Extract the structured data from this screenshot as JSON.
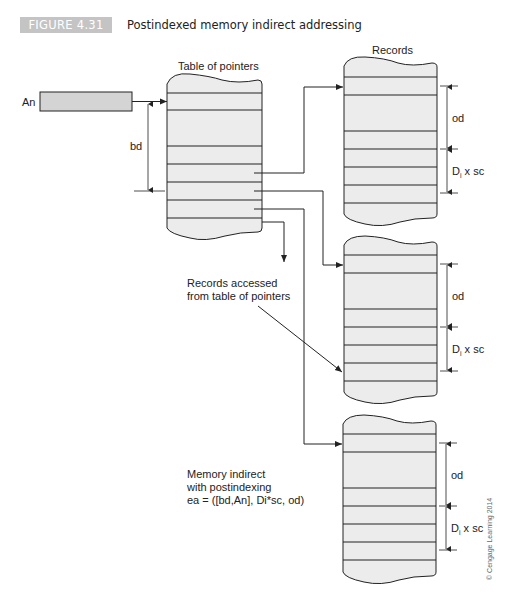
{
  "figure": {
    "badge": "FIGURE 4.31",
    "title": "Postindexed memory indirect addressing"
  },
  "labels": {
    "address_register": "An",
    "base_displacement": "bd",
    "pointer_table": "Table of pointers",
    "records": "Records",
    "records_accessed_line1": "Records accessed",
    "records_accessed_line2": "from table of pointers",
    "note_line1": "Memory indirect",
    "note_line2": "with postindexing",
    "note_line3": "ea = ([bd,An], Di*sc, od)",
    "outer_displacement": "od",
    "index_scale_base": "D",
    "index_scale_sub": "i",
    "index_scale_rest": " x sc",
    "credit": "© Cengage Learning 2014"
  },
  "colors": {
    "badge_bg": "#c4c4c4",
    "fill": "#ececec",
    "stroke": "#222222"
  }
}
